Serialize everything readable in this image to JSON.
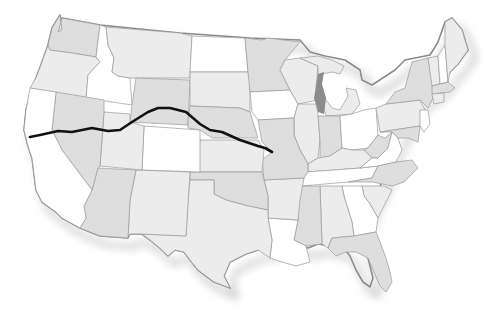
{
  "map": {
    "subject": "United States (contiguous 48 states)",
    "style": "grayscale with drop shadow",
    "colors": {
      "background": "#ffffff",
      "state_light": "#ececec",
      "state_mid": "#dedede",
      "state_white": "#ffffff",
      "border": "#9a9a9a",
      "outline": "#8a8a8a",
      "lakes": "#8c8c8c",
      "shadow": "#6a6a6a",
      "route": "#111111"
    },
    "route": {
      "description": "Black overland trail line from eastern Kansas/Missouri border west across Nebraska, Wyoming, Utah and Nevada to northern California",
      "points": [
        [
          272,
          152
        ],
        [
          265,
          148
        ],
        [
          258,
          146
        ],
        [
          240,
          140
        ],
        [
          222,
          132
        ],
        [
          210,
          130
        ],
        [
          200,
          124
        ],
        [
          186,
          112
        ],
        [
          170,
          108
        ],
        [
          158,
          108
        ],
        [
          148,
          112
        ],
        [
          132,
          122
        ],
        [
          120,
          130
        ],
        [
          108,
          131
        ],
        [
          92,
          128
        ],
        [
          72,
          132
        ],
        [
          58,
          131
        ],
        [
          40,
          135
        ],
        [
          30,
          137
        ]
      ]
    },
    "labels": []
  }
}
